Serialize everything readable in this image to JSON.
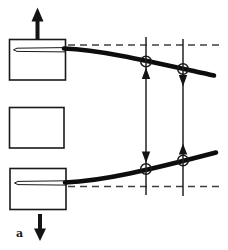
{
  "figure": {
    "panel_label": "a",
    "colors": {
      "ink": "#191919",
      "beam": "#0d0d0d",
      "dash": "#3f3f3f",
      "background": "#ffffff"
    },
    "icons": {
      "top_load": "up-arrow",
      "bottom_load": "down-arrow",
      "left_gauge_top": "up-arrowhead",
      "left_gauge_bottom": "down-arrowhead",
      "right_gauge_top": "down-arrowhead",
      "right_gauge_bottom": "up-arrowhead",
      "measurement_marker": "open-circle",
      "reference_line": "dashed-line"
    }
  }
}
